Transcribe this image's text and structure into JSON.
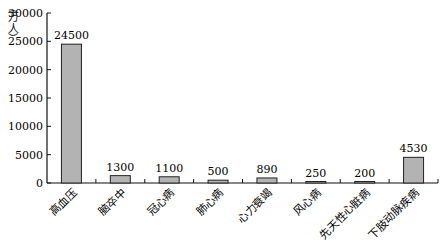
{
  "chart_data": {
    "type": "bar",
    "title": "",
    "xlabel": "",
    "ylabel": "万人",
    "ylim": [
      0,
      30000
    ],
    "yticks": [
      0,
      5000,
      10000,
      15000,
      20000,
      25000,
      30000
    ],
    "grid": false,
    "legend": null,
    "categories": [
      "高血压",
      "脑卒中",
      "冠心病",
      "肺心病",
      "心力衰竭",
      "风心病",
      "先天性心脏病",
      "下肢动脉疾病"
    ],
    "values": [
      24500,
      1300,
      1100,
      500,
      890,
      250,
      200,
      4530
    ],
    "data_labels": [
      "24500",
      "1300",
      "1100",
      "500",
      "890",
      "250",
      "200",
      "4530"
    ],
    "bar_color": "#b3b3b3",
    "bar_edge_color": "#222222"
  }
}
